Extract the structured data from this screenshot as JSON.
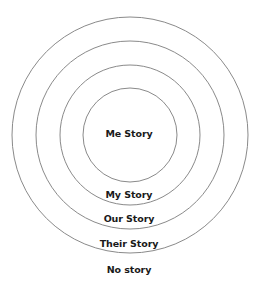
{
  "diagram": {
    "type": "concentric-circles",
    "center": {
      "x": 130,
      "y": 135
    },
    "stroke_color": "#8a8a8a",
    "text_color": "#1a1a1a",
    "circles": [
      {
        "name": "me-story",
        "radius": 47
      },
      {
        "name": "my-story",
        "radius": 70
      },
      {
        "name": "our-story",
        "radius": 94
      },
      {
        "name": "their-story",
        "radius": 118
      }
    ],
    "labels": [
      {
        "text": "Me Story",
        "y": 128
      },
      {
        "text": "My Story",
        "y": 189
      },
      {
        "text": "Our Story",
        "y": 213
      },
      {
        "text": "Their Story",
        "y": 238
      },
      {
        "text": "No story",
        "y": 264
      }
    ]
  }
}
